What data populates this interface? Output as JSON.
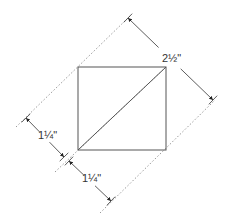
{
  "diagram": {
    "type": "cutting-diagram",
    "colors": {
      "square_stroke": "#555555",
      "dotted_line": "#9a9a9a",
      "dimension_line": "#333333",
      "background": "#ffffff"
    },
    "square": {
      "x": 78,
      "y": 67,
      "width": 88,
      "height": 83
    },
    "diagonal": {
      "x1": 78,
      "y1": 150,
      "x2": 166,
      "y2": 67
    },
    "dotted_lines": [
      {
        "id": "upper-left-guide",
        "x1": 16,
        "y1": 127,
        "x2": 130,
        "y2": 16
      },
      {
        "id": "center-guide",
        "x1": 55,
        "y1": 172,
        "x2": 166,
        "y2": 67
      },
      {
        "id": "lower-right-guide",
        "x1": 100,
        "y1": 213,
        "x2": 215,
        "y2": 100
      }
    ],
    "dimensions": [
      {
        "id": "total-width",
        "label": "2½\"",
        "x1": 128,
        "y1": 18,
        "x2": 213,
        "y2": 100,
        "label_x": 162,
        "label_y": 62
      },
      {
        "id": "upper-half-width",
        "label": "1¼\"",
        "x1": 26,
        "y1": 118,
        "x2": 64,
        "y2": 157,
        "label_x": 38,
        "label_y": 139
      },
      {
        "id": "lower-half-width",
        "label": "1¼\"",
        "x1": 69,
        "y1": 161,
        "x2": 111,
        "y2": 201,
        "label_x": 82,
        "label_y": 182
      }
    ]
  }
}
